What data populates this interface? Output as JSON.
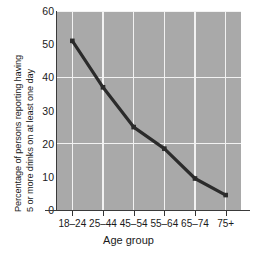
{
  "chart_data": {
    "type": "line",
    "title": "",
    "xlabel": "Age group",
    "ylabel_line1": "Percentage of persons reporting having",
    "ylabel_line2": "5 or more drinks on at least one day",
    "categories": [
      "18–24",
      "25–44",
      "45–54",
      "55–64",
      "65–74",
      "75+"
    ],
    "values": [
      51,
      37,
      25,
      18.5,
      9.5,
      4.5
    ],
    "ylim": [
      0,
      60
    ],
    "yticks": [
      0,
      10,
      20,
      30,
      40,
      50,
      60
    ],
    "ytick_labels": [
      "0",
      "10",
      "20",
      "30",
      "40",
      "50",
      "60"
    ],
    "gridlines_y": [
      20,
      40,
      60
    ],
    "grid": true,
    "legend": "none",
    "series": [
      {
        "name": "Percentage reporting 5+ drinks",
        "values": [
          51,
          37,
          25,
          18.5,
          9.5,
          4.5
        ],
        "marker": "square",
        "line_color": "#2b2b2b",
        "marker_color": "#2b2b2b"
      }
    ],
    "colors": {
      "plot_background": "#a9a9a9",
      "figure_background": "#ffffff",
      "gridline": "#f2f2f2",
      "axis": "#3a3a3a",
      "text": "#1a1a1a"
    }
  }
}
